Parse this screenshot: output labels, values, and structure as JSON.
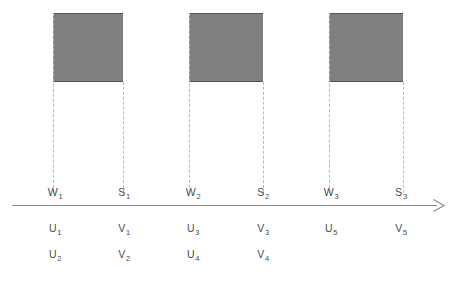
{
  "figure": {
    "width": 455,
    "height": 283,
    "background": "#ffffff",
    "block_fill": "#808080",
    "block_border": "#555555",
    "dropline_color": "#b9b9b9",
    "axis_color": "#8a8a8a",
    "text_color": "#4a4a4a"
  },
  "blocks": [
    {
      "name": "block-1",
      "x": 53,
      "y": 13,
      "width": 70,
      "height": 69
    },
    {
      "name": "block-2",
      "x": 189,
      "y": 13,
      "width": 74,
      "height": 69
    },
    {
      "name": "block-3",
      "x": 329,
      "y": 13,
      "width": 74,
      "height": 69
    }
  ],
  "droplines": [
    {
      "name": "dropline-w1",
      "x": 53,
      "y": 13,
      "height": 180
    },
    {
      "name": "dropline-s1",
      "x": 123,
      "y": 82,
      "height": 111
    },
    {
      "name": "dropline-w2",
      "x": 189,
      "y": 13,
      "height": 180
    },
    {
      "name": "dropline-s2",
      "x": 263,
      "y": 82,
      "height": 111
    },
    {
      "name": "dropline-w3",
      "x": 329,
      "y": 13,
      "height": 180
    },
    {
      "name": "dropline-s3",
      "x": 403,
      "y": 82,
      "height": 111
    }
  ],
  "axis": {
    "name": "time-axis",
    "x": 12,
    "y": 205,
    "length": 425,
    "arrow_label": "arrow-right-icon"
  },
  "axis_labels": [
    {
      "base": "W",
      "sub": "1",
      "x": 55,
      "y": 186
    },
    {
      "base": "S",
      "sub": "1",
      "x": 124,
      "y": 186
    },
    {
      "base": "W",
      "sub": "2",
      "x": 193,
      "y": 186
    },
    {
      "base": "S",
      "sub": "2",
      "x": 263,
      "y": 186
    },
    {
      "base": "W",
      "sub": "3",
      "x": 331,
      "y": 186
    },
    {
      "base": "S",
      "sub": "3",
      "x": 401,
      "y": 186
    }
  ],
  "row_labels": [
    {
      "base": "U",
      "sub": "1",
      "x": 55,
      "y": 222
    },
    {
      "base": "V",
      "sub": "1",
      "x": 124,
      "y": 222
    },
    {
      "base": "U",
      "sub": "3",
      "x": 193,
      "y": 222
    },
    {
      "base": "V",
      "sub": "3",
      "x": 263,
      "y": 222
    },
    {
      "base": "U",
      "sub": "5",
      "x": 331,
      "y": 222
    },
    {
      "base": "V",
      "sub": "5",
      "x": 401,
      "y": 222
    },
    {
      "base": "U",
      "sub": "2",
      "x": 55,
      "y": 248
    },
    {
      "base": "V",
      "sub": "2",
      "x": 124,
      "y": 248
    },
    {
      "base": "U",
      "sub": "4",
      "x": 193,
      "y": 248
    },
    {
      "base": "V",
      "sub": "4",
      "x": 263,
      "y": 248
    }
  ],
  "chart_data": {
    "type": "bar",
    "title": "",
    "xlabel": "",
    "ylabel": "",
    "grid": false,
    "legend": null,
    "axis_direction": "right-arrow",
    "categories": [
      "interval 1",
      "interval 2",
      "interval 3"
    ],
    "intervals": [
      {
        "start_label": "W1",
        "end_label": "S1",
        "start_x": 53,
        "end_x": 123,
        "height": 69,
        "start_symbols": [
          "U1",
          "U2"
        ],
        "end_symbols": [
          "V1",
          "V2"
        ]
      },
      {
        "start_label": "W2",
        "end_label": "S2",
        "start_x": 189,
        "end_x": 263,
        "height": 69,
        "start_symbols": [
          "U3",
          "U4"
        ],
        "end_symbols": [
          "V3",
          "V4"
        ]
      },
      {
        "start_label": "W3",
        "end_label": "S3",
        "start_x": 329,
        "end_x": 403,
        "height": 69,
        "start_symbols": [
          "U5"
        ],
        "end_symbols": [
          "V5"
        ]
      }
    ],
    "values": [
      69,
      69,
      69
    ]
  }
}
